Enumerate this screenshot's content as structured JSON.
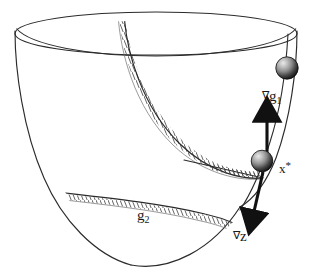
{
  "figure": {
    "type": "diagram",
    "width": 314,
    "height": 273,
    "background_color": "#ffffff",
    "line_color": "#2b2b2b",
    "arrow_color": "#111111",
    "hatch_color": "#555555"
  },
  "labels": {
    "grad_g1": {
      "nabla": "∇",
      "base": "g",
      "sub": "1"
    },
    "grad_z": {
      "nabla": "∇",
      "base": "z",
      "sub": ""
    },
    "g2": {
      "nabla": "",
      "base": "g",
      "sub": "2"
    },
    "x_star": {
      "base": "x",
      "star": "*"
    }
  },
  "elements": {
    "bowl_surface": "paraboloid-bowl",
    "bowl_rim": "top-ellipse-rim",
    "constraint_curve_g1": "hatched-constraint-curve-g1",
    "constraint_curve_g2": "hatched-constraint-curve-g2",
    "ridge_curve": "right-side-ridge-curve",
    "tangent_line": "tangent-line-at-optimum",
    "sphere_upper": "ball-marker-upper",
    "sphere_optimum": "ball-marker-at-optimum",
    "arrow_up": "gradient-arrow-g1",
    "arrow_down": "gradient-arrow-z"
  },
  "colors": {
    "sphere_light": "#d8d8d8",
    "sphere_mid": "#8a8a8a",
    "sphere_dark": "#151515",
    "outline": "#2b2b2b"
  }
}
